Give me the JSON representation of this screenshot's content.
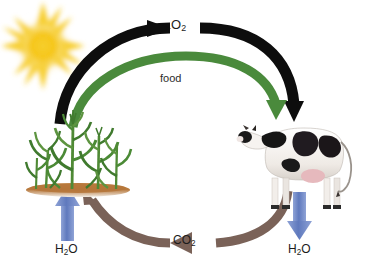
{
  "diagram": {
    "background_color": "#ffffff",
    "width": 365,
    "height": 269
  },
  "labels": {
    "oxygen": {
      "text": "O",
      "subscript": "2",
      "full": "O2",
      "color": "#1c1c1c"
    },
    "food": {
      "text": "food",
      "color": "#2b2b2b"
    },
    "carbon_dioxide": {
      "text": "CO",
      "subscript": "2",
      "full": "CO2",
      "color": "#1c1c1c"
    },
    "water_left": {
      "text": "H",
      "subscript": "2",
      "suffix": "O",
      "full": "H2O",
      "color": "#1c1c1c"
    },
    "water_right": {
      "text": "H",
      "subscript": "2",
      "suffix": "O",
      "full": "H2O",
      "color": "#1c1c1c"
    }
  },
  "actors": {
    "sun": {
      "name": "sun",
      "core_color": "#f5c518",
      "ray_color": "#f9d64a",
      "glow_color": "#fbe79a",
      "center_x": 43,
      "center_y": 46,
      "core_radius": 23,
      "ray_reach": 39
    },
    "plant": {
      "name": "corn-plants",
      "leaf_color": "#3f7a2e",
      "leaf_color_light": "#6aa844",
      "stem_color": "#5d9440",
      "soil_color": "#b5763a",
      "soil_highlight": "#d9a05e",
      "x": 28,
      "y": 112,
      "width": 104,
      "height": 80
    },
    "cow": {
      "name": "holstein-cow",
      "body_color": "#f4f1ee",
      "patch_color": "#1a1a1a",
      "udder_color": "#e6b9bd",
      "shadow_color": "#cfcac5",
      "x": 245,
      "y": 122,
      "width": 110,
      "height": 73
    }
  },
  "arrows": {
    "oxygen_arc": {
      "name": "oxygen-arrow",
      "color": "#0d0d0d",
      "from": "plant",
      "to": "cow",
      "label": "O2",
      "direction": "clockwise-top"
    },
    "food_arc": {
      "name": "food-arrow",
      "color": "#4a8a3c",
      "from": "plant",
      "to": "cow",
      "label": "food",
      "direction": "clockwise-top-inner"
    },
    "carbon_dioxide_arc": {
      "name": "carbon-dioxide-arrow",
      "color": "#7a6258",
      "from": "cow",
      "to": "plant",
      "label": "CO2",
      "direction": "counterclockwise-bottom"
    },
    "water_up": {
      "name": "water-uptake-arrow",
      "color": "#6b83c4",
      "direction": "up",
      "target": "plant",
      "label": "H2O"
    },
    "water_down": {
      "name": "water-release-arrow",
      "color": "#6b83c4",
      "direction": "down",
      "source": "cow",
      "label": "H2O"
    }
  }
}
